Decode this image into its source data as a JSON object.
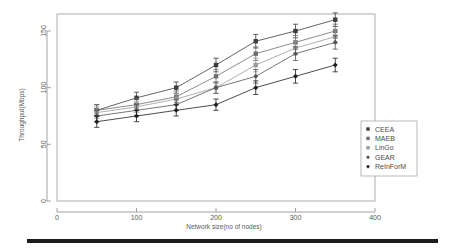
{
  "chart_data": {
    "type": "line",
    "title": "",
    "xlabel": "Network size(no of nodes)",
    "ylabel": "Throughput(Mbps)",
    "x": [
      50,
      100,
      150,
      200,
      250,
      300,
      350
    ],
    "xlim": [
      0,
      400
    ],
    "ylim": [
      0,
      165
    ],
    "xticks": [
      0,
      100,
      200,
      300,
      400
    ],
    "yticks": [
      0,
      50,
      100,
      150
    ],
    "xtick_labels": [
      "0",
      "100",
      "200",
      "300",
      "400"
    ],
    "ytick_labels": [
      "0",
      "50",
      "100",
      "150"
    ],
    "grid": false,
    "legend_position": "center-right-inside",
    "error_bars": true,
    "series": [
      {
        "name": "CEEA",
        "color": "#3d3d3d",
        "marker": "square",
        "values": [
          80,
          91,
          100,
          120,
          141,
          150,
          160
        ],
        "errors": [
          5,
          5,
          5,
          6,
          6,
          6,
          6
        ]
      },
      {
        "name": "MAEB",
        "color": "#6e6e6e",
        "marker": "square",
        "values": [
          80,
          85,
          92,
          110,
          130,
          140,
          150
        ],
        "errors": [
          5,
          5,
          5,
          6,
          6,
          6,
          6
        ]
      },
      {
        "name": "LinGo",
        "color": "#9a9a9a",
        "marker": "square",
        "values": [
          78,
          83,
          90,
          100,
          120,
          135,
          145
        ],
        "errors": [
          5,
          5,
          5,
          5,
          6,
          6,
          6
        ]
      },
      {
        "name": "GEAR",
        "color": "#555555",
        "marker": "diamond",
        "values": [
          75,
          80,
          85,
          100,
          110,
          130,
          140
        ],
        "errors": [
          5,
          5,
          5,
          5,
          6,
          6,
          6
        ]
      },
      {
        "name": "ReInForM",
        "color": "#1f1f1f",
        "marker": "diamond",
        "values": [
          70,
          75,
          80,
          85,
          100,
          110,
          120
        ],
        "errors": [
          5,
          5,
          5,
          5,
          6,
          6,
          6
        ]
      }
    ]
  },
  "legend": {
    "entries": [
      {
        "label": "CEEA"
      },
      {
        "label": "MAEB"
      },
      {
        "label": "LinGo"
      },
      {
        "label": "GEAR"
      },
      {
        "label": "ReInForM"
      }
    ]
  }
}
